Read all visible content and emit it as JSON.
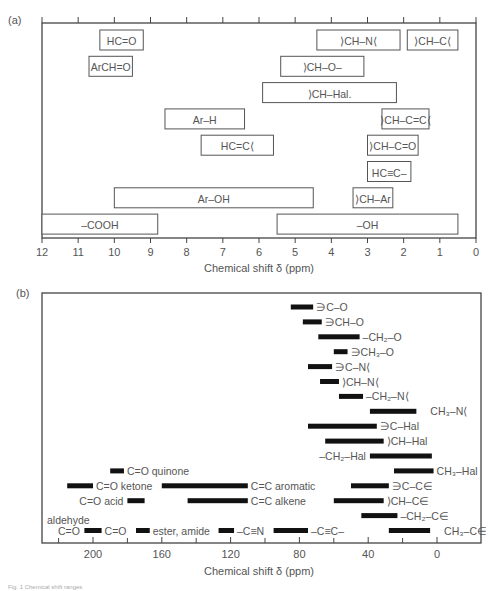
{
  "chart_data": [
    {
      "panel": "(a)",
      "type": "range-box",
      "title": "",
      "xlabel": "Chemical shift δ (ppm)",
      "xlim": [
        12,
        0
      ],
      "x_reversed": true,
      "xticks": [
        12,
        11,
        10,
        9,
        8,
        7,
        6,
        5,
        4,
        3,
        2,
        1,
        0
      ],
      "rows": 9,
      "ranges": [
        {
          "label": "HC=O",
          "from": 10.4,
          "to": 9.2,
          "row": 0
        },
        {
          "label": "⟩CH–N⟨",
          "from": 4.4,
          "to": 2.1,
          "row": 0
        },
        {
          "label": "⟩CH–C⟨",
          "from": 1.9,
          "to": 0.5,
          "row": 0
        },
        {
          "label": "ArCH=O",
          "from": 10.7,
          "to": 9.5,
          "row": 1
        },
        {
          "label": "⟩CH–O–",
          "from": 5.4,
          "to": 3.1,
          "row": 1
        },
        {
          "label": "⟩CH–Hal.",
          "from": 5.9,
          "to": 2.2,
          "row": 2
        },
        {
          "label": "Ar–H",
          "from": 8.6,
          "to": 6.4,
          "row": 3
        },
        {
          "label": "⟩CH–C=C⟨",
          "from": 2.6,
          "to": 1.3,
          "row": 3
        },
        {
          "label": "HC=C⟨",
          "from": 7.6,
          "to": 5.6,
          "row": 4
        },
        {
          "label": "⟩CH–C=O",
          "from": 3.0,
          "to": 1.6,
          "row": 4
        },
        {
          "label": "HC≡C–",
          "from": 3.0,
          "to": 1.8,
          "row": 5
        },
        {
          "label": "Ar–OH",
          "from": 10.0,
          "to": 4.5,
          "row": 6
        },
        {
          "label": "⟩CH–Ar",
          "from": 3.4,
          "to": 2.3,
          "row": 6
        },
        {
          "label": "–COOH",
          "from": 12.0,
          "to": 8.8,
          "row": 7
        },
        {
          "label": "–OH",
          "from": 5.5,
          "to": 0.5,
          "row": 7
        }
      ]
    },
    {
      "panel": "(b)",
      "type": "range-bar",
      "title": "",
      "xlabel": "Chemical shift δ (ppm)",
      "xlim": [
        230,
        -26
      ],
      "x_reversed": true,
      "xticks": [
        200,
        160,
        120,
        80,
        40,
        0
      ],
      "minor_xticks": [
        220,
        180,
        140,
        100,
        60,
        20
      ],
      "rows": 16,
      "ranges": [
        {
          "label": "∋C–O",
          "from": 85,
          "to": 72,
          "row": 0,
          "label_side": "right"
        },
        {
          "label": "∋CH–O",
          "from": 78,
          "to": 67,
          "row": 1,
          "label_side": "right"
        },
        {
          "label": "–CH₂–O",
          "from": 69,
          "to": 45,
          "row": 2,
          "label_side": "right"
        },
        {
          "label": "∋CH₃–O",
          "from": 60,
          "to": 52,
          "row": 3,
          "label_side": "right"
        },
        {
          "label": "∋C–N⟨",
          "from": 75,
          "to": 61,
          "row": 4,
          "label_side": "right"
        },
        {
          "label": "⟩CH–N⟨",
          "from": 68,
          "to": 57,
          "row": 5,
          "label_side": "right"
        },
        {
          "label": "–CH₂–N⟨",
          "from": 57,
          "to": 43,
          "row": 6,
          "label_side": "right"
        },
        {
          "label": "CH₃–N⟨",
          "from": 39,
          "to": 12,
          "row": 7,
          "label_side": "right-far"
        },
        {
          "label": "∋C–Hal",
          "from": 75,
          "to": 35,
          "row": 8,
          "label_side": "right"
        },
        {
          "label": "⟩CH–Hal",
          "from": 65,
          "to": 31,
          "row": 9,
          "label_side": "right"
        },
        {
          "label": "–CH₂–Hal",
          "from": 39,
          "to": 3,
          "row": 10,
          "label_side": "left"
        },
        {
          "label": "CH₃–Hal",
          "from": 25,
          "to": 2,
          "row": 11,
          "label_side": "right"
        },
        {
          "label": "C=O quinone",
          "from": 190,
          "to": 182,
          "row": 11,
          "label_side": "right"
        },
        {
          "label": "C=O ketone",
          "from": 215,
          "to": 200,
          "row": 12,
          "label_side": "right"
        },
        {
          "label": "C=C aromatic",
          "from": 160,
          "to": 110,
          "row": 12,
          "label_side": "right"
        },
        {
          "label": "∋C–C∈",
          "from": 50,
          "to": 28,
          "row": 12,
          "label_side": "right"
        },
        {
          "label": "C=O acid",
          "from": 180,
          "to": 170,
          "row": 13,
          "label_side": "left"
        },
        {
          "label": "C=C alkene",
          "from": 145,
          "to": 110,
          "row": 13,
          "label_side": "right"
        },
        {
          "label": "⟩CH–C∈",
          "from": 60,
          "to": 31,
          "row": 13,
          "label_side": "right"
        },
        {
          "label": "–CH₂–C∈",
          "from": 44,
          "to": 23,
          "row": 14,
          "label_side": "right"
        },
        {
          "label": "C=O",
          "from": 205,
          "to": 195,
          "row": 15,
          "label_side": "right"
        },
        {
          "label": "ester, amide",
          "from": 175,
          "to": 167,
          "row": 15,
          "label_side": "right"
        },
        {
          "label": "–C≡N",
          "from": 127,
          "to": 118,
          "row": 15,
          "label_side": "right"
        },
        {
          "label": "–C≡C–",
          "from": 95,
          "to": 75,
          "row": 15,
          "label_side": "right"
        },
        {
          "label": "CH₃–C∈",
          "from": 28,
          "to": 4,
          "row": 15,
          "label_side": "right-far"
        }
      ],
      "annotations": [
        {
          "text": "aldehyde",
          "row": 14.4
        },
        {
          "text": "C=O",
          "row": 15
        }
      ]
    }
  ],
  "caption": "Fig. 1  Chemical shift ranges"
}
